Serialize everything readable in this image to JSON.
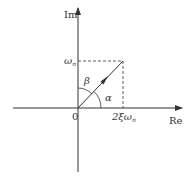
{
  "diagram": {
    "title": "",
    "axes": {
      "x_label": "Re",
      "y_label": "Im",
      "origin_label": "0"
    },
    "vector": {
      "x_label_prefix": "2ξω",
      "x_label_sub": "n",
      "y_label_prefix": "ω",
      "y_label_sub": "n"
    },
    "angles": {
      "alpha": "α",
      "beta": "β"
    },
    "colors": {
      "line": "#333333",
      "background": "#ffffff"
    }
  }
}
